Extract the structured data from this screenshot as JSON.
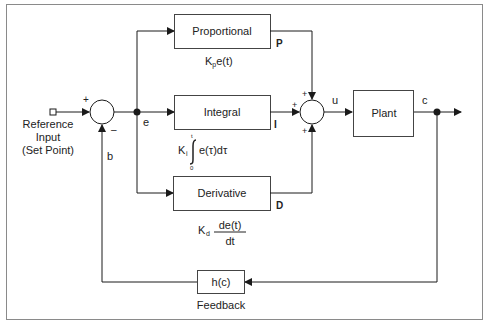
{
  "diagram": {
    "input": {
      "label_line1": "Reference",
      "label_line2": "Input",
      "label_line3": "(Set Point)"
    },
    "summing_junction_1": {
      "plus": "+",
      "minus": "–"
    },
    "signals": {
      "error": "e",
      "feedback": "b",
      "control": "u",
      "output": "c",
      "p": "P",
      "i": "I",
      "d": "D"
    },
    "blocks": {
      "proportional": {
        "label": "Proportional",
        "formula_k": "K",
        "formula_sub": "p",
        "formula_rest": "e(t)"
      },
      "integral": {
        "label": "Integral",
        "formula_k": "K",
        "formula_sub": "i",
        "formula_integrand": "e(τ)dτ",
        "upper": "t",
        "lower": "0"
      },
      "derivative": {
        "label": "Derivative",
        "formula_k": "K",
        "formula_sub": "d",
        "numerator": "de(t)",
        "denominator": "dt"
      },
      "plant": {
        "label": "Plant"
      },
      "feedback": {
        "label": "h(c)",
        "caption": "Feedback"
      }
    },
    "summing_junction_2": {
      "top": "+",
      "left": "+",
      "bottom": "+"
    },
    "colors": {
      "line": "#1a1a1a",
      "frame": "#888888",
      "box_border": "#444444"
    }
  }
}
